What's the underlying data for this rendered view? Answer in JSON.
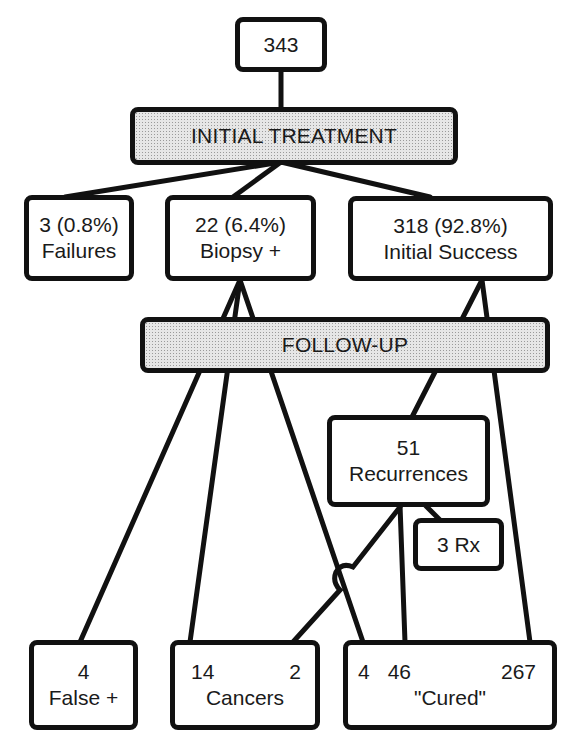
{
  "root": {
    "count": "343"
  },
  "stages": {
    "initial_treatment": "INITIAL TREATMENT",
    "follow_up": "FOLLOW-UP"
  },
  "initial_outcomes": {
    "failures": {
      "value": "3 (0.8%)",
      "label": "Failures"
    },
    "biopsy_positive": {
      "value": "22 (6.4%)",
      "label": "Biopsy +"
    },
    "initial_success": {
      "value": "318 (92.8%)",
      "label": "Initial Success"
    }
  },
  "recurrences": {
    "value": "51",
    "label": "Recurrences"
  },
  "retreatment": {
    "label": "3 Rx"
  },
  "final_outcomes": {
    "false_positive": {
      "value": "4",
      "label": "False +"
    },
    "cancers": {
      "values": [
        "14",
        "2"
      ],
      "label": "Cancers"
    },
    "cured": {
      "values": [
        "4",
        "46",
        "267"
      ],
      "label": "\"Cured\""
    }
  },
  "colors": {
    "line": "#111111",
    "bar_fill": "#e6e6e6",
    "box_fill": "#ffffff"
  }
}
